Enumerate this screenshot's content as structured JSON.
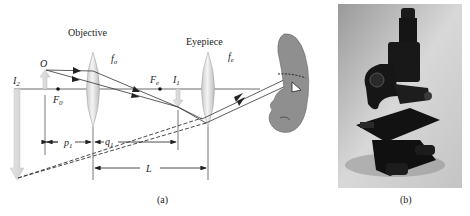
{
  "figure_a": {
    "caption": "(a)",
    "objective_label": "Objective",
    "eyepiece_label": "Eyepiece",
    "objective_focal": "f",
    "objective_focal_sub": "o",
    "eyepiece_focal": "f",
    "eyepiece_focal_sub": "e",
    "object_label": "O",
    "f0_label": "F",
    "f0_sub": "0",
    "fe_label": "F",
    "fe_sub": "e",
    "i1_label": "I",
    "i1_sub": "1",
    "i2_label": "I",
    "i2_sub": "2",
    "p1_label": "p",
    "p1_sub": "1",
    "q1_label": "q",
    "q1_sub": "1",
    "L_label": "L"
  },
  "figure_b": {
    "caption": "(b)",
    "subject": "compound microscope photograph"
  }
}
